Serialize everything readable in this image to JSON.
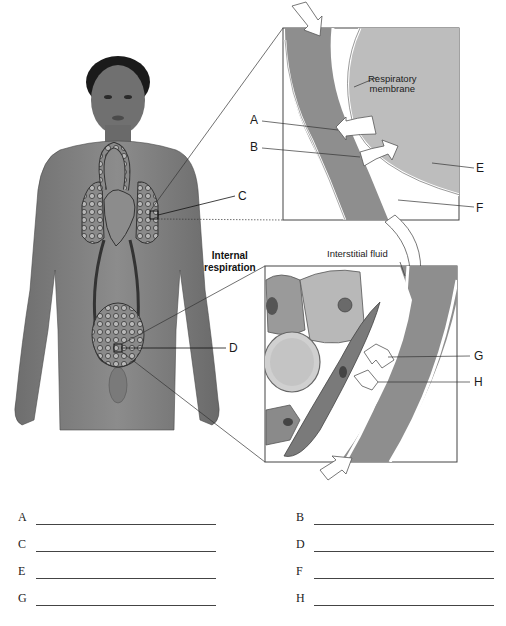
{
  "figure": {
    "labels": {
      "respiratory_membrane": "Respiratory membrane",
      "respiratory_membrane_line1": "Respiratory",
      "respiratory_membrane_line2": "membrane",
      "interstitial_fluid": "Interstitial fluid",
      "internal_respiration_line1": "Internal",
      "internal_respiration_line2": "respiration",
      "A": "A",
      "B": "B",
      "C": "C",
      "D": "D",
      "E": "E",
      "F": "F",
      "G": "G",
      "H": "H"
    }
  },
  "answers": [
    {
      "letter": "A",
      "value": ""
    },
    {
      "letter": "B",
      "value": ""
    },
    {
      "letter": "C",
      "value": ""
    },
    {
      "letter": "D",
      "value": ""
    },
    {
      "letter": "E",
      "value": ""
    },
    {
      "letter": "F",
      "value": ""
    },
    {
      "letter": "G",
      "value": ""
    },
    {
      "letter": "H",
      "value": ""
    }
  ]
}
